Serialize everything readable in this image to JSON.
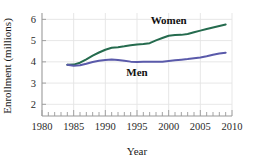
{
  "chart_data": {
    "type": "line",
    "title": "",
    "xlabel": "Year",
    "ylabel": "Enrollment (millions)",
    "xlim": [
      1980,
      2010
    ],
    "ylim": [
      1.45,
      6.3
    ],
    "xticks": [
      1980,
      1985,
      1990,
      1995,
      2000,
      2005,
      2010
    ],
    "xtick_labels": [
      "1980",
      "1985",
      "1990",
      "1995",
      "2000",
      "2005",
      "2010"
    ],
    "xminor_tick_step": 1,
    "yticks": [
      2,
      3,
      4,
      5,
      6
    ],
    "ytick_labels": [
      "2",
      "3",
      "4",
      "5",
      "6"
    ],
    "grid": "vertical-and-horizontal-light",
    "legend_position": "inline-annotations",
    "series": [
      {
        "name": "Women",
        "color": "#256b4e",
        "label_x": 2000,
        "label_y": 5.95,
        "x": [
          1984,
          1985,
          1986,
          1987,
          1988,
          1989,
          1990,
          1991,
          1992,
          1993,
          1994,
          1995,
          1996,
          1997,
          1998,
          1999,
          2000,
          2001,
          2002,
          2003,
          2004,
          2005,
          2006,
          2007,
          2008,
          2009
        ],
        "values": [
          3.86,
          3.87,
          3.96,
          4.12,
          4.29,
          4.44,
          4.57,
          4.66,
          4.69,
          4.73,
          4.78,
          4.82,
          4.84,
          4.88,
          5.01,
          5.12,
          5.23,
          5.26,
          5.27,
          5.31,
          5.39,
          5.47,
          5.55,
          5.62,
          5.69,
          5.76
        ]
      },
      {
        "name": "Men",
        "color": "#5a5aaa",
        "label_x": 1995,
        "label_y": 3.52,
        "x": [
          1984,
          1985,
          1986,
          1987,
          1988,
          1989,
          1990,
          1991,
          1992,
          1993,
          1994,
          1995,
          1996,
          1997,
          1998,
          1999,
          2000,
          2001,
          2002,
          2003,
          2004,
          2005,
          2006,
          2007,
          2008,
          2009
        ],
        "values": [
          3.86,
          3.82,
          3.84,
          3.91,
          3.99,
          4.05,
          4.09,
          4.11,
          4.09,
          4.05,
          4.01,
          3.99,
          4.0,
          4.0,
          4.0,
          4.0,
          4.04,
          4.07,
          4.1,
          4.13,
          4.17,
          4.21,
          4.26,
          4.33,
          4.39,
          4.43
        ]
      }
    ]
  },
  "axes": {
    "y_axis_title": "Enrollment (millions)",
    "x_axis_title": "Year"
  },
  "colors": {
    "women_line": "#256b4e",
    "men_line": "#5a5aaa",
    "axis": "#9a9a9a",
    "grid": "#e4e4e4",
    "text": "#1a1a1a"
  }
}
